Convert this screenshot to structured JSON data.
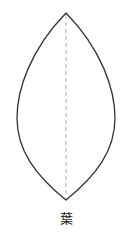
{
  "diagram": {
    "shape": "leaf",
    "label": "葉",
    "colors": {
      "outline": "#333333",
      "midrib": "#bbbbbb",
      "background": "#ffffff"
    }
  }
}
